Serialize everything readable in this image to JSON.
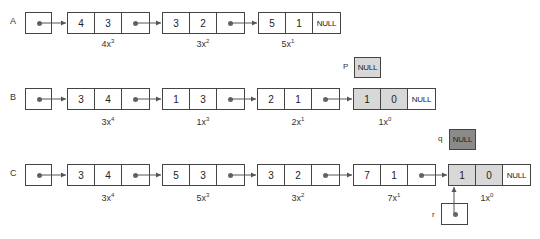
{
  "lists": [
    {
      "name": "A",
      "nodes": [
        {
          "coef": "4",
          "exp": "3",
          "term_base": "4x",
          "term_exp": "3",
          "last": false,
          "highlight": false
        },
        {
          "coef": "3",
          "exp": "2",
          "term_base": "3x",
          "term_exp": "2",
          "last": false,
          "highlight": false
        },
        {
          "coef": "5",
          "exp": "1",
          "term_base": "5x",
          "term_exp": "1",
          "last": true,
          "highlight": false
        }
      ]
    },
    {
      "name": "B",
      "nodes": [
        {
          "coef": "3",
          "exp": "4",
          "term_base": "3x",
          "term_exp": "4",
          "last": false,
          "highlight": false
        },
        {
          "coef": "1",
          "exp": "3",
          "term_base": "1x",
          "term_exp": "3",
          "last": false,
          "highlight": false
        },
        {
          "coef": "2",
          "exp": "1",
          "term_base": "2x",
          "term_exp": "1",
          "last": false,
          "highlight": false
        },
        {
          "coef": "1",
          "exp": "0",
          "term_base": "1x",
          "term_exp": "0",
          "last": true,
          "highlight": true
        }
      ]
    },
    {
      "name": "C",
      "nodes": [
        {
          "coef": "3",
          "exp": "4",
          "term_base": "3x",
          "term_exp": "4",
          "last": false,
          "highlight": false
        },
        {
          "coef": "5",
          "exp": "3",
          "term_base": "5x",
          "term_exp": "3",
          "last": false,
          "highlight": false
        },
        {
          "coef": "3",
          "exp": "2",
          "term_base": "3x",
          "term_exp": "2",
          "last": false,
          "highlight": false
        },
        {
          "coef": "7",
          "exp": "1",
          "term_base": "7x",
          "term_exp": "1",
          "last": false,
          "highlight": false
        },
        {
          "coef": "1",
          "exp": "0",
          "term_base": "1x",
          "term_exp": "0",
          "last": true,
          "highlight": true
        }
      ]
    }
  ],
  "null_text": "NULL",
  "pointers": {
    "p": {
      "label": "P",
      "value": "NULL",
      "color": "#d8d8d8"
    },
    "q": {
      "label": "q",
      "value": "NULL",
      "color": "#8a8a8a"
    },
    "r": {
      "label": "r"
    }
  },
  "colors": {
    "highlight_cell": "#d8d8d8",
    "q_box": "#8a8a8a",
    "line": "#555555"
  }
}
